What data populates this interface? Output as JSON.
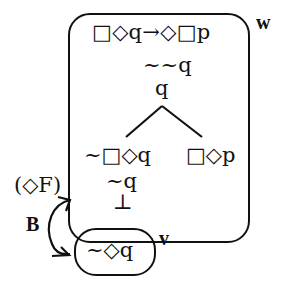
{
  "diagram": {
    "type": "modal-logic-tree",
    "worlds": [
      {
        "name": "w",
        "label": "w",
        "lines": {
          "premise": "□◇q→◇□p",
          "negated_conclusion": "~~q",
          "derived": "q",
          "left_branch": "~□◇q",
          "right_branch": "□◇p",
          "left_sub1": "~q",
          "left_sub2": "⊥"
        }
      },
      {
        "name": "v",
        "label": "v",
        "lines": {
          "content": "~◇q"
        }
      }
    ],
    "rule_annotation": "(◇F)",
    "relation_label": "B",
    "colors": {
      "ink": "#111111",
      "background": "#ffffff"
    }
  }
}
